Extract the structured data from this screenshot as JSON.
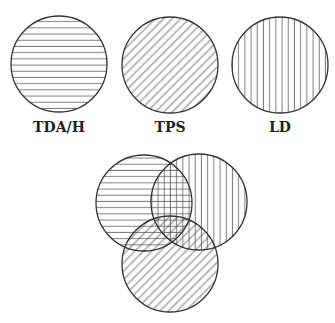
{
  "diagram": {
    "type": "venn",
    "legend": [
      {
        "id": "tdah",
        "label": "TDA/H",
        "pattern": "horizontal-lines",
        "cx": 59,
        "cy": 64,
        "r": 48
      },
      {
        "id": "tps",
        "label": "TPS",
        "pattern": "diagonal-lines",
        "cx": 170,
        "cy": 65,
        "r": 48
      },
      {
        "id": "ld",
        "label": "LD",
        "pattern": "vertical-lines",
        "cx": 280,
        "cy": 65,
        "r": 48
      }
    ],
    "venn": [
      {
        "ref": "tdah",
        "cx": 144,
        "cy": 203,
        "r": 48
      },
      {
        "ref": "ld",
        "cx": 199,
        "cy": 202,
        "r": 48
      },
      {
        "ref": "tps",
        "cx": 170,
        "cy": 264,
        "r": 48
      }
    ],
    "colors": {
      "stroke": "#333333",
      "hatch": "#555555",
      "background": "#ffffff"
    }
  }
}
